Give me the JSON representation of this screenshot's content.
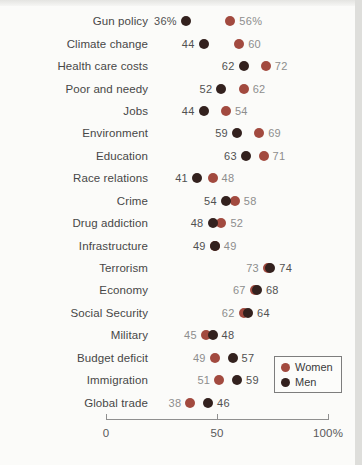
{
  "chart_data": {
    "type": "scatter",
    "subtype": "dumbbell-dot-plot",
    "title": "",
    "categories": [
      "Gun policy",
      "Climate change",
      "Health care costs",
      "Poor and needy",
      "Jobs",
      "Environment",
      "Education",
      "Race relations",
      "Crime",
      "Drug addiction",
      "Infrastructure",
      "Terrorism",
      "Economy",
      "Social Security",
      "Military",
      "Budget deficit",
      "Immigration",
      "Global trade"
    ],
    "series": [
      {
        "name": "Women",
        "color": "#a24a3f",
        "value_text_color": "#8d8d8d",
        "values": [
          56,
          60,
          72,
          62,
          54,
          69,
          71,
          48,
          58,
          52,
          49,
          73,
          67,
          62,
          45,
          49,
          51,
          38
        ]
      },
      {
        "name": "Men",
        "color": "#33211e",
        "value_text_color": "#515151",
        "values": [
          36,
          44,
          62,
          52,
          44,
          59,
          63,
          41,
          54,
          48,
          49,
          74,
          68,
          64,
          48,
          57,
          59,
          46
        ]
      }
    ],
    "xlim": [
      0,
      100
    ],
    "x_ticks": [
      {
        "value": 0,
        "label": "0"
      },
      {
        "value": 50,
        "label": "50"
      },
      {
        "value": 100,
        "label": "100%"
      }
    ],
    "first_row_unit_suffix": "%",
    "grid": false,
    "legend": {
      "position": "bottom-right",
      "items": [
        "Women",
        "Men"
      ]
    }
  }
}
